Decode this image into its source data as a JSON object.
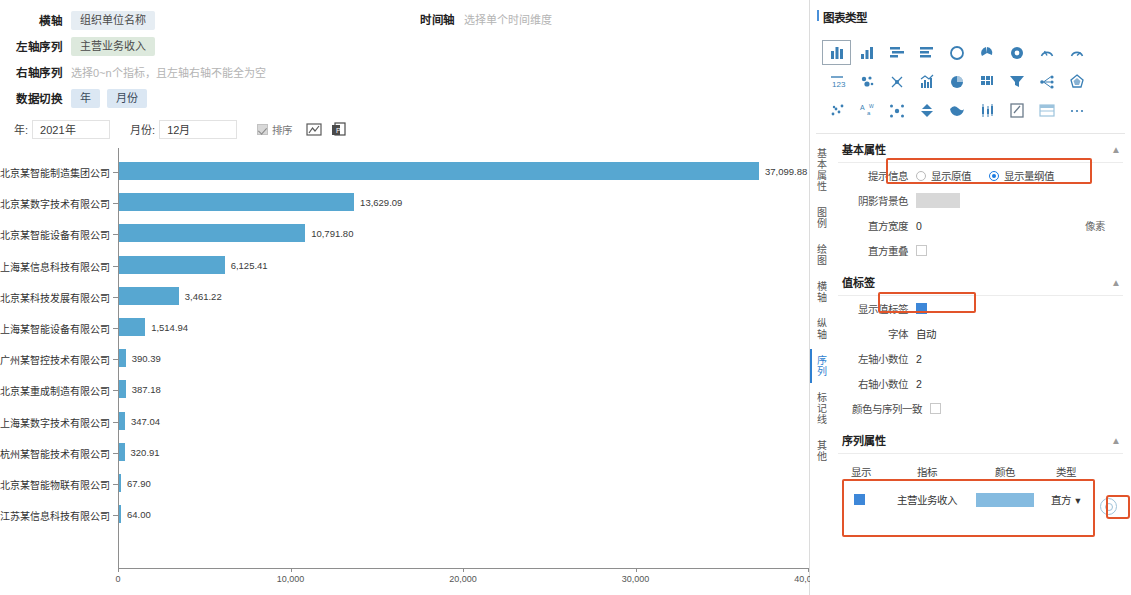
{
  "config": {
    "x_axis_label": "横轴",
    "x_axis_value": "组织单位名称",
    "left_series_label": "左轴序列",
    "left_series_value": "主营业务收入",
    "right_series_label": "右轴序列",
    "right_series_placeholder": "选择0~n个指标，且左轴右轴不能全为空",
    "data_switch_label": "数据切换",
    "data_switch_options": [
      "年",
      "月份"
    ],
    "time_axis_label": "时间轴",
    "time_axis_placeholder": "选择单个时间维度"
  },
  "filters": {
    "year_label": "年:",
    "year_value": "2021年",
    "month_label": "月份:",
    "month_value": "12月",
    "sort_label": "排序",
    "sort_checked": true,
    "export_icon": "export-chart-icon",
    "copy_icon": "copy-to-doc-icon"
  },
  "chart_data": {
    "type": "bar",
    "orientation": "horizontal",
    "title": "",
    "xlabel": "",
    "ylabel": "",
    "xlim": [
      0,
      40000
    ],
    "xticks": [
      "0",
      "10,000",
      "20,000",
      "30,000",
      "40,000"
    ],
    "xtick_values": [
      0,
      10000,
      20000,
      30000,
      40000
    ],
    "grid": false,
    "legend": "none",
    "series_name": "主营业务收入",
    "bar_color": "#57a7d1",
    "categories": [
      "北京某智能制造集团公司",
      "北京某数字技术有限公司",
      "北京某智能设备有限公司",
      "上海某信息科技有限公司",
      "北京某科技发展有限公司",
      "上海某智能设备有限公司",
      "广州某智控技术有限公司",
      "北京某重成制造有限公司",
      "上海某数字技术有限公司",
      "杭州某智能技术有限公司",
      "北京某智能物联有限公司",
      "江苏某信息科技有限公司"
    ],
    "values": [
      37099.88,
      13629.09,
      10791.8,
      6125.41,
      3461.22,
      1514.94,
      390.39,
      387.18,
      347.04,
      320.91,
      67.9,
      64.0
    ],
    "value_labels": [
      "37,099.88",
      "13,629.09",
      "10,791.80",
      "6,125.41",
      "3,461.22",
      "1,514.94",
      "390.39",
      "387.18",
      "347.04",
      "320.91",
      "67.90",
      "64.00"
    ]
  },
  "right_panel": {
    "chart_type_title": "图表类型",
    "chart_type_icons": [
      "bar-chart-icon",
      "column-chart-icon",
      "stacked-bar-icon",
      "horizontal-bar-icon",
      "ring-chart-icon",
      "pie-chart-icon",
      "donut-chart-icon",
      "gauge-icon",
      "half-gauge-icon",
      "number-card-icon",
      "bubble-chart-icon",
      "network-chart-icon",
      "histogram-mix-icon",
      "pie-filled-icon",
      "matrix-icon",
      "funnel-icon",
      "tree-chart-icon",
      "radar-icon",
      "scatter-icon",
      "wordcloud-icon",
      "relation-icon",
      "pyramid-icon",
      "map-icon",
      "candlestick-icon",
      "edit-chart-icon",
      "table-icon",
      "more-icon"
    ],
    "chart_type_selected_index": 0,
    "vertical_tabs": [
      "基本属性",
      "图例",
      "绘图",
      "横轴",
      "纵轴",
      "序列",
      "标记线",
      "其他"
    ],
    "vertical_tab_active": "序列",
    "basic": {
      "title": "基本属性",
      "tips_label": "提示信息",
      "tips_option_raw": "显示原值",
      "tips_option_scaled": "显示量纲值",
      "tips_selected": "显示量纲值",
      "shadow_bg_label": "阴影背景色",
      "bar_width_label": "直方宽度",
      "bar_width_value": "0",
      "bar_width_unit": "像素",
      "bar_overlap_label": "直方重叠",
      "bar_overlap_checked": false
    },
    "value_label": {
      "title": "值标签",
      "show_label": "显示值标签",
      "show_checked": true,
      "font_label": "字体",
      "font_value": "自动",
      "left_decimals_label": "左轴小数位",
      "left_decimals_value": "2",
      "right_decimals_label": "右轴小数位",
      "right_decimals_value": "2",
      "color_match_label": "颜色与序列一致",
      "color_match_checked": false
    },
    "series_props": {
      "title": "序列属性",
      "headers": [
        "显示",
        "指标",
        "颜色",
        "类型"
      ],
      "rows": [
        {
          "show": true,
          "indicator": "主营业务收入",
          "color": "#85bbe0",
          "type": "直方"
        }
      ],
      "settings_icon": "gear-icon"
    }
  }
}
